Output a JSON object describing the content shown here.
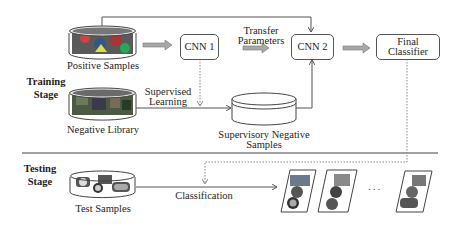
{
  "diagram": {
    "stages": {
      "training": "Training\nStage",
      "training_line1": "Training",
      "training_line2": "Stage",
      "testing_line1": "Testing",
      "testing_line2": "Stage"
    },
    "nodes": {
      "positive_samples": "Positive Samples",
      "negative_library": "Negative Library",
      "cnn1": "CNN 1",
      "cnn2": "CNN 2",
      "final_classifier_line1": "Final",
      "final_classifier_line2": "Classifier",
      "supervisory_negative_line1": "Supervisory Negative",
      "supervisory_negative_line2": "Samples",
      "test_samples": "Test Samples"
    },
    "edges": {
      "transfer_parameters_line1": "Transfer",
      "transfer_parameters_line2": "Parameters",
      "supervised_learning_line1": "Supervised",
      "supervised_learning_line2": "Learning",
      "classification": "Classification"
    },
    "ellipsis": "...",
    "colors": {
      "line": "#555555",
      "block_arrow": "#9a9a9a",
      "dotted": "#8a8a8a",
      "separator": "#444444"
    }
  }
}
